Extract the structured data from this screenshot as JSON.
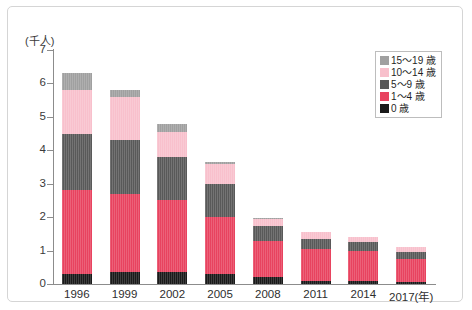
{
  "chart_data": {
    "type": "bar",
    "stacked": true,
    "title": "",
    "subtitle": "",
    "xlabel": "",
    "ylabel": "",
    "unit_label": "(千人)",
    "year_suffix": "(年)",
    "categories": [
      "1996",
      "1999",
      "2002",
      "2005",
      "2008",
      "2011",
      "2014",
      "2017"
    ],
    "xtick_labels": [
      "1996",
      "1999",
      "2002",
      "2005",
      "2008",
      "2011",
      "2014",
      "2017(年)"
    ],
    "ylim": [
      0,
      7
    ],
    "yticks": [
      0,
      1,
      2,
      3,
      4,
      5,
      6,
      7
    ],
    "ytick_labels": [
      "0",
      "1",
      "2",
      "3",
      "4",
      "5",
      "6",
      "7"
    ],
    "grid": false,
    "legend_position": "top-right",
    "series": [
      {
        "name": "0 歳",
        "color": "#1a1a1a",
        "values": [
          0.3,
          0.35,
          0.35,
          0.3,
          0.2,
          0.1,
          0.08,
          0.07
        ]
      },
      {
        "name": "1〜4 歳",
        "color": "#e8435f",
        "values": [
          2.5,
          2.35,
          2.15,
          1.7,
          1.1,
          0.95,
          0.92,
          0.68
        ]
      },
      {
        "name": "5〜9 歳",
        "color": "#595959",
        "values": [
          1.7,
          1.6,
          1.3,
          1.0,
          0.45,
          0.3,
          0.25,
          0.2
        ]
      },
      {
        "name": "10〜14 歳",
        "color": "#f8c0cc",
        "values": [
          1.3,
          1.3,
          0.75,
          0.6,
          0.2,
          0.2,
          0.15,
          0.15
        ]
      },
      {
        "name": "15〜19 歳",
        "color": "#a0a0a0",
        "values": [
          0.5,
          0.2,
          0.25,
          0.05,
          0.02,
          0.02,
          0.02,
          0.02
        ]
      }
    ],
    "totals": [
      6.3,
      5.8,
      4.8,
      3.65,
      1.97,
      1.57,
      1.42,
      1.12
    ],
    "legend": [
      {
        "label": "15〜19 歳",
        "color": "#a0a0a0"
      },
      {
        "label": "10〜14 歳",
        "color": "#f8c0cc"
      },
      {
        "label": "5〜9 歳",
        "color": "#595959"
      },
      {
        "label": "1〜4 歳",
        "color": "#e8435f"
      },
      {
        "label": "0 歳",
        "color": "#1a1a1a"
      }
    ]
  }
}
